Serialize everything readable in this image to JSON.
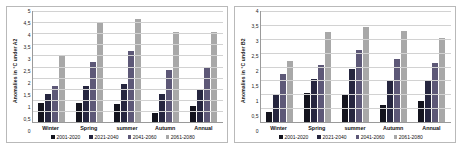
{
  "figure": {
    "panels": [
      {
        "id": "panel-a2",
        "ylabel": "Anomalies in °C under A2",
        "chart_data": {
          "type": "bar",
          "title": "",
          "xlabel": "",
          "ylabel": "Anomalies in °C under A2",
          "categories": [
            "Winter",
            "Spring",
            "summer",
            "Autumn",
            "Annual"
          ],
          "ylim": [
            0,
            5
          ],
          "yticks": [
            0,
            0.5,
            1,
            1.5,
            2,
            2.5,
            3,
            3.5,
            4,
            4.5,
            5
          ],
          "ytick_labels": [
            "0",
            "0,5",
            "1",
            "1,5",
            "2",
            "2,5",
            "3",
            "3,5",
            "4",
            "4,5",
            "5"
          ],
          "grid": true,
          "legend_position": "bottom",
          "series": [
            {
              "name": "2001-2020",
              "color": "#14141e",
              "values": [
                0.85,
                0.85,
                0.8,
                0.4,
                0.7
              ]
            },
            {
              "name": "2021-2040",
              "color": "#26263f",
              "values": [
                1.25,
                1.6,
                1.7,
                1.25,
                1.45
              ]
            },
            {
              "name": "2041-2060",
              "color": "#5d5877",
              "values": [
                1.6,
                2.7,
                3.2,
                2.35,
                2.5
              ]
            },
            {
              "name": "2061-2080",
              "color": "#a8a8a8",
              "values": [
                3.0,
                4.45,
                4.65,
                4.05,
                4.05
              ]
            }
          ]
        }
      },
      {
        "id": "panel-b2",
        "ylabel": "Anomalies in °C under B2",
        "chart_data": {
          "type": "bar",
          "title": "",
          "xlabel": "",
          "ylabel": "Anomalies in °C under B2",
          "categories": [
            "Winter",
            "Spring",
            "summer",
            "Autumn",
            "Annual"
          ],
          "ylim": [
            0,
            4
          ],
          "yticks": [
            0,
            0.5,
            1,
            1.5,
            2,
            2.5,
            3,
            3.5,
            4
          ],
          "ytick_labels": [
            "0",
            "0,5",
            "1",
            "1,5",
            "2",
            "2,5",
            "3",
            "3,5",
            "4"
          ],
          "grid": true,
          "legend_position": "bottom",
          "series": [
            {
              "name": "2001-2020",
              "color": "#14141e",
              "values": [
                0.35,
                1.05,
                1.0,
                0.62,
                0.75
              ]
            },
            {
              "name": "2021-2040",
              "color": "#26263f",
              "values": [
                1.0,
                1.55,
                1.9,
                1.53,
                1.47
              ]
            },
            {
              "name": "2041-2060",
              "color": "#5d5877",
              "values": [
                1.72,
                2.05,
                2.6,
                2.28,
                2.13
              ]
            },
            {
              "name": "2061-2080",
              "color": "#a8a8a8",
              "values": [
                2.2,
                3.25,
                3.43,
                3.28,
                3.03
              ]
            }
          ]
        }
      }
    ]
  }
}
